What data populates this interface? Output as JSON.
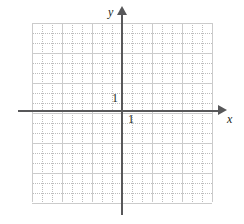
{
  "figure": {
    "type": "coordinate-grid",
    "title": ""
  },
  "axes": {
    "x": {
      "label": "x",
      "arrow": "right",
      "unit_tick_label": "1"
    },
    "y": {
      "label": "y",
      "arrow": "up",
      "unit_tick_label": "1"
    }
  },
  "grid": {
    "minor_spacing_px": 10,
    "major_every": 3,
    "columns": 18,
    "rows": 18,
    "minor_color": "#bdbdbd",
    "major_color": "#cbcbcb",
    "axis_color": "#58585a",
    "background": "#ffffff"
  },
  "chart_data": {
    "type": "scatter",
    "title": "",
    "xlabel": "x",
    "ylabel": "y",
    "x": [],
    "y": [],
    "series": [],
    "xlim": [
      -9,
      9
    ],
    "ylim": [
      -9,
      9
    ],
    "xticks": [
      1
    ],
    "yticks": [
      1
    ],
    "xticklabels": [
      "1"
    ],
    "yticklabels": [
      "1"
    ],
    "grid": true,
    "legend": "none",
    "annotations": []
  }
}
